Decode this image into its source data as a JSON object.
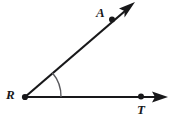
{
  "figure": {
    "type": "geometry-angle-diagram",
    "background_color": "#ffffff",
    "stroke_color": "#18181a",
    "stroke_width": 2,
    "labels": {
      "vertex": "R",
      "ray_point_upper": "A",
      "ray_point_lower": "T"
    },
    "points": [
      {
        "name": "R",
        "label": "R",
        "x": 25,
        "y": 97,
        "dot": true,
        "role": "vertex"
      },
      {
        "name": "A",
        "label": "A",
        "x": 112,
        "y": 19,
        "dot": true,
        "role": "point-on-ray"
      },
      {
        "name": "T",
        "label": "T",
        "x": 141,
        "y": 97,
        "dot": true,
        "role": "point-on-ray"
      }
    ],
    "rays": [
      {
        "name": "ray-RA",
        "from": "R",
        "through": "A",
        "x1": 25,
        "y1": 97,
        "x2": 131,
        "y2": 6,
        "arrow": true
      },
      {
        "name": "ray-RT",
        "from": "R",
        "through": "T",
        "x1": 25,
        "y1": 97,
        "x2": 159,
        "y2": 97,
        "arrow": true
      }
    ],
    "angle_arc": {
      "name": "angle-arc-ARt",
      "center_x": 25,
      "center_y": 97,
      "radius": 36,
      "start_x": 52,
      "start_y": 73,
      "end_x": 61,
      "end_y": 97,
      "measure_degrees": 41
    },
    "arrowheads": [
      {
        "name": "arrowhead-ray-RA",
        "tip_x": 135,
        "tip_y": 2,
        "angle_degrees": -40.6
      },
      {
        "name": "arrowhead-ray-RT",
        "tip_x": 168,
        "tip_y": 97,
        "angle_degrees": 0
      }
    ]
  }
}
